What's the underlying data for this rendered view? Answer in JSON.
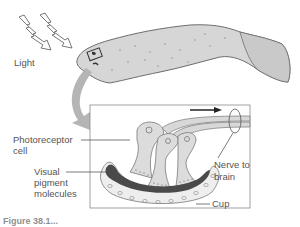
{
  "diagram": {
    "labels": {
      "light": "Light",
      "photoreceptor": "Photoreceptor",
      "photoreceptor_line2": "cell",
      "visual_pigment": "Visual",
      "visual_pigment_line2": "pigment",
      "visual_pigment_line3": "molecules",
      "nerve": "Nerve to",
      "nerve_line2": "brain",
      "cup": "Cup"
    },
    "caption": "Figure 38.1..."
  },
  "colors": {
    "body_fill": "#d6d6d6",
    "body_stroke": "#6e6e6e",
    "arrow_fill": "#b5b5b5",
    "pigment": "#4a4a4a",
    "inset_border": "#8a8a8a"
  }
}
